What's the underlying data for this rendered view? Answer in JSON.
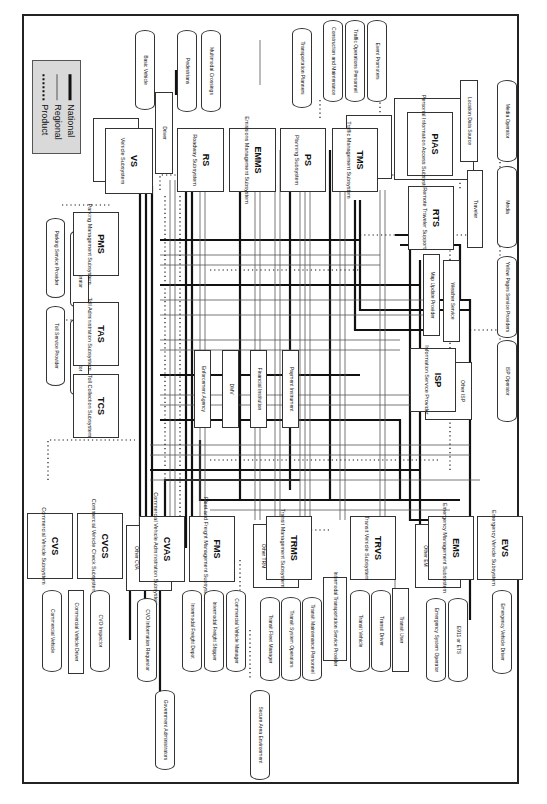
{
  "legend": {
    "items": [
      {
        "label": "National",
        "style": "solid-thick"
      },
      {
        "label": "Regional",
        "style": "solid-thin"
      },
      {
        "label": "Product",
        "style": "dotted"
      }
    ]
  },
  "subsystems": [
    {
      "id": "vs",
      "abbr": "VS",
      "name": "Vehicle Subsystem"
    },
    {
      "id": "rs",
      "abbr": "RS",
      "name": "Roadway Subsystem"
    },
    {
      "id": "emms",
      "abbr": "EMMS",
      "name": "Emissions Management Subsystem"
    },
    {
      "id": "ps",
      "abbr": "PS",
      "name": "Planning Subsystem"
    },
    {
      "id": "tms",
      "abbr": "TMS",
      "name": "Traffic Management Subsystem"
    },
    {
      "id": "pias",
      "abbr": "PIAS",
      "name": "Personal Information Access Subsystem"
    },
    {
      "id": "rts",
      "abbr": "RTS",
      "name": "Remote Traveler Support"
    },
    {
      "id": "isp",
      "abbr": "ISP",
      "name": "Information Service Provider"
    },
    {
      "id": "pms",
      "abbr": "PMS",
      "name": "Parking Management Subsystem"
    },
    {
      "id": "tas",
      "abbr": "TAS",
      "name": "Toll Administration Subsystem"
    },
    {
      "id": "tcs",
      "abbr": "TCS",
      "name": "Toll Collection Subsystem"
    },
    {
      "id": "cvs",
      "abbr": "CVS",
      "name": "Commercial Vehicle Subsystem"
    },
    {
      "id": "cvcs",
      "abbr": "CVCS",
      "name": "Commercial Vehicle Check Subsystem"
    },
    {
      "id": "cvas",
      "abbr": "CVAS",
      "name": "Commercial Vehicle Administration Subsystem"
    },
    {
      "id": "fms",
      "abbr": "FMS",
      "name": "Fleet and Freight Management Subsystem"
    },
    {
      "id": "trms",
      "abbr": "TRMS",
      "name": "Transit Management Subsystem"
    },
    {
      "id": "trvs",
      "abbr": "TRVS",
      "name": "Transit Vehicle Subsystem"
    },
    {
      "id": "ems",
      "abbr": "EMS",
      "name": "Emergency Management Subsystem"
    },
    {
      "id": "evs",
      "abbr": "EVS",
      "name": "Emergency Vehicle Subsystem"
    }
  ],
  "other_boxes": {
    "other_vehicle": "Other Vehicle",
    "driver": "Driver",
    "other_tm": "Other TM",
    "location_data_source": "Location Data Source",
    "traveler": "Traveler",
    "map_update_provider": "Map Update Provider",
    "weather_service": "Weather Service",
    "other_isp": "Other ISP",
    "enforcement_agency": "Enforcement Agency",
    "dmv": "DMV",
    "financial_institution": "Financial Institution",
    "payment_instrument": "Payment Instrument",
    "other_cva": "Other CVA",
    "other_trm": "Other TRM",
    "other_em": "Other EM",
    "commercial_vehicle_driver": "Commercial Vehicle Driver",
    "intermodal_transportation_service_provider": "Intermodal Transportation Service Provider",
    "transit_user": "Transit User"
  },
  "terminators": {
    "basic_vehicle": "Basic Vehicle",
    "pedestrians": "Pedestrians",
    "multimodal_crossings": "Multimodal Crossings",
    "transportation_planners": "Transportation Planners",
    "construction_and_maintenance": "Construction and Maintenance",
    "traffic_operations_personnel": "Traffic Operations Personnel",
    "event_promoters": "Event Promoters",
    "media_operator": "Media Operator",
    "media": "Media",
    "yellow_pages_service_providers": "Yellow Pages Service Providers",
    "isp_operator": "ISP Operator",
    "parking_service_provider": "Parking Service Provider",
    "parking_operator": "Parking Operator",
    "toll_service_provider": "Toll Service Provider",
    "toll_operator": "Toll Operator",
    "commercial_vehicle": "Commercial Vehicle",
    "cvo_inspector": "CVO Inspector",
    "cvo_information_requestor": "CVO Information Requestor",
    "government_administrators": "Government Administrators",
    "intermodal_freight_depot": "Intermodal Freight Depot",
    "intermodal_freight_shipper": "Intermodal Freight Shipper",
    "commercial_vehicle_manager": "Commercial Vehicle Manager",
    "secure_area_environment": "Secure Area Environment",
    "transit_fleet_manager": "Transit Fleet Manager",
    "transit_system_operators": "Transit System Operators",
    "transit_maintenance_personnel": "Transit Maintenance Personnel",
    "transit_vehicle": "Transit Vehicle",
    "transit_driver": "Transit Driver",
    "emergency_system_operator": "Emergency System Operator",
    "e911_or_ets": "E911 or ETS",
    "emergency_vehicle_driver": "Emergency Vehicle Driver"
  },
  "colors": {
    "line": "#111111",
    "thin_line": "#555555",
    "legend_bg": "#d9d9d9",
    "background": "#ffffff"
  }
}
